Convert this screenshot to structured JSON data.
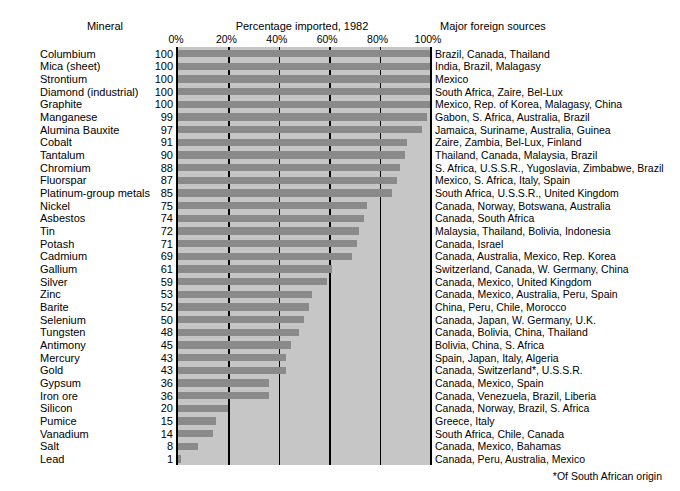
{
  "header": {
    "mineral_label": "Mineral",
    "chart_title": "Percentage imported, 1982",
    "sources_label": "Major foreign sources"
  },
  "footnote": "*Of South African origin",
  "colors": {
    "bar": "#8a8a8a",
    "plot_background": "#c6c6c6",
    "gridline": "#000000",
    "text": "#000000",
    "page_background": "#ffffff"
  },
  "chart_data": {
    "type": "bar",
    "orientation": "horizontal",
    "title": "Percentage imported, 1982",
    "xlabel": "",
    "ylabel": "Mineral",
    "xlim": [
      0,
      100
    ],
    "xticks": [
      0,
      20,
      40,
      60,
      80,
      100
    ],
    "xticklabels": [
      "0%",
      "20%",
      "40%",
      "60%",
      "80%",
      "100%"
    ],
    "grid": true,
    "legend": false,
    "categories": [
      "Columbium",
      "Mica (sheet)",
      "Strontium",
      "Diamond (industrial)",
      "Graphite",
      "Manganese",
      "Alumina Bauxite",
      "Cobalt",
      "Tantalum",
      "Chromium",
      "Fluorspar",
      "Platinum-group metals",
      "Nickel",
      "Asbestos",
      "Tin",
      "Potash",
      "Cadmium",
      "Gallium",
      "Silver",
      "Zinc",
      "Barite",
      "Selenium",
      "Tungsten",
      "Antimony",
      "Mercury",
      "Gold",
      "Gypsum",
      "Iron ore",
      "Silicon",
      "Pumice",
      "Vanadium",
      "Salt",
      "Lead"
    ],
    "values": [
      100,
      100,
      100,
      100,
      100,
      99,
      97,
      91,
      90,
      88,
      87,
      85,
      75,
      74,
      72,
      71,
      69,
      61,
      59,
      53,
      52,
      50,
      48,
      45,
      43,
      43,
      36,
      36,
      20,
      15,
      14,
      8,
      1
    ],
    "annotations": [
      "Brazil, Canada, Thailand",
      "India, Brazil, Malagasy",
      "Mexico",
      "South Africa, Zaire, Bel-Lux",
      "Mexico, Rep. of Korea, Malagasy, China",
      "Gabon, S. Africa, Australia, Brazil",
      "Jamaica, Suriname, Australia, Guinea",
      "Zaire, Zambia, Bel-Lux, Finland",
      "Thailand, Canada, Malaysia, Brazil",
      "S. Africa, U.S.S.R., Yugoslavia, Zimbabwe, Brazil",
      "Mexico, S. Africa, Italy, Spain",
      "South Africa, U.S.S.R., United Kingdom",
      "Canada, Norway, Botswana, Australia",
      "Canada, South Africa",
      "Malaysia, Thailand, Bolivia, Indonesia",
      "Canada, Israel",
      "Canada, Australia, Mexico, Rep. Korea",
      "Switzerland, Canada, W. Germany, China",
      "Canada, Mexico, United Kingdom",
      "Canada, Mexico, Australia, Peru, Spain",
      "China, Peru, Chile, Morocco",
      "Canada, Japan, W. Germany, U.K.",
      "Canada, Bolivia, China, Thailand",
      "Bolivia, China, S. Africa",
      "Spain, Japan, Italy, Algeria",
      "Canada, Switzerland*, U.S.S.R.",
      "Canada, Mexico, Spain",
      "Canada, Venezuela, Brazil, Liberia",
      "Canada, Norway, Brazil, S. Africa",
      "Greece, Italy",
      "South Africa, Chile, Canada",
      "Canada, Mexico, Bahamas",
      "Canada, Peru, Australia, Mexico"
    ]
  }
}
